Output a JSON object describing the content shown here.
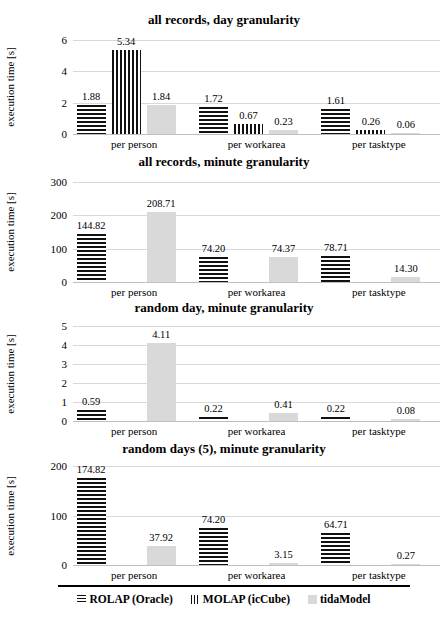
{
  "figure": {
    "ylabel": "execution time [s]",
    "categories": [
      "per person",
      "per workarea",
      "per tasktype"
    ],
    "legend": {
      "position": "bottom",
      "items": [
        {
          "name": "ROLAP (Oracle)",
          "marker": "horizontal-stripes",
          "color": "#111111"
        },
        {
          "name": "MOLAP (icCube)",
          "marker": "vertical-stripes",
          "color": "#111111"
        },
        {
          "name": "tidaModel",
          "marker": "solid-fill",
          "color": "#d9d9d9"
        }
      ]
    }
  },
  "chart_data": [
    {
      "type": "bar",
      "title": "all records, day granularity",
      "xlabel": "",
      "ylabel": "execution time [s]",
      "categories": [
        "per person",
        "per workarea",
        "per tasktype"
      ],
      "ylim": [
        0,
        6
      ],
      "yticks": [
        0,
        2,
        4,
        6
      ],
      "grid": true,
      "series": [
        {
          "name": "ROLAP (Oracle)",
          "values": [
            1.88,
            1.72,
            1.61
          ],
          "labels": [
            "1.88",
            "1.72",
            "1.61"
          ]
        },
        {
          "name": "MOLAP (icCube)",
          "values": [
            5.34,
            0.67,
            0.26
          ],
          "labels": [
            "5.34",
            "0.67",
            "0.26"
          ]
        },
        {
          "name": "tidaModel",
          "values": [
            1.84,
            0.23,
            0.06
          ],
          "labels": [
            "1.84",
            "0.23",
            "0.06"
          ]
        }
      ]
    },
    {
      "type": "bar",
      "title": "all records, minute granularity",
      "xlabel": "",
      "ylabel": "execution time [s]",
      "categories": [
        "per person",
        "per workarea",
        "per tasktype"
      ],
      "ylim": [
        0,
        300
      ],
      "yticks": [
        0,
        100,
        200,
        300
      ],
      "grid": true,
      "series": [
        {
          "name": "ROLAP (Oracle)",
          "values": [
            144.82,
            74.2,
            78.71
          ],
          "labels": [
            "144.82",
            "74.20",
            "78.71"
          ]
        },
        {
          "name": "MOLAP (icCube)",
          "values": [
            null,
            null,
            null
          ],
          "labels": [
            "",
            "",
            ""
          ]
        },
        {
          "name": "tidaModel",
          "values": [
            208.71,
            74.37,
            14.3
          ],
          "labels": [
            "208.71",
            "74.37",
            "14.30"
          ]
        }
      ]
    },
    {
      "type": "bar",
      "title": "random day, minute granularity",
      "xlabel": "",
      "ylabel": "execution time [s]",
      "categories": [
        "per person",
        "per workarea",
        "per tasktype"
      ],
      "ylim": [
        0,
        5
      ],
      "yticks": [
        0,
        1,
        2,
        3,
        4,
        5
      ],
      "grid": true,
      "series": [
        {
          "name": "ROLAP (Oracle)",
          "values": [
            0.59,
            0.22,
            0.22
          ],
          "labels": [
            "0.59",
            "0.22",
            "0.22"
          ]
        },
        {
          "name": "MOLAP (icCube)",
          "values": [
            null,
            null,
            null
          ],
          "labels": [
            "",
            "",
            ""
          ]
        },
        {
          "name": "tidaModel",
          "values": [
            4.11,
            0.41,
            0.08
          ],
          "labels": [
            "4.11",
            "0.41",
            "0.08"
          ]
        }
      ]
    },
    {
      "type": "bar",
      "title": "random days (5), minute granularity",
      "xlabel": "",
      "ylabel": "execution time [s]",
      "categories": [
        "per person",
        "per workarea",
        "per tasktype"
      ],
      "ylim": [
        0,
        200
      ],
      "yticks": [
        0,
        100,
        200
      ],
      "grid": true,
      "series": [
        {
          "name": "ROLAP (Oracle)",
          "values": [
            174.82,
            74.2,
            64.71
          ],
          "labels": [
            "174.82",
            "74.20",
            "64.71"
          ]
        },
        {
          "name": "MOLAP (icCube)",
          "values": [
            null,
            null,
            null
          ],
          "labels": [
            "",
            "",
            ""
          ]
        },
        {
          "name": "tidaModel",
          "values": [
            37.92,
            3.15,
            0.27
          ],
          "labels": [
            "37.92",
            "3.15",
            "0.27"
          ]
        }
      ]
    }
  ]
}
